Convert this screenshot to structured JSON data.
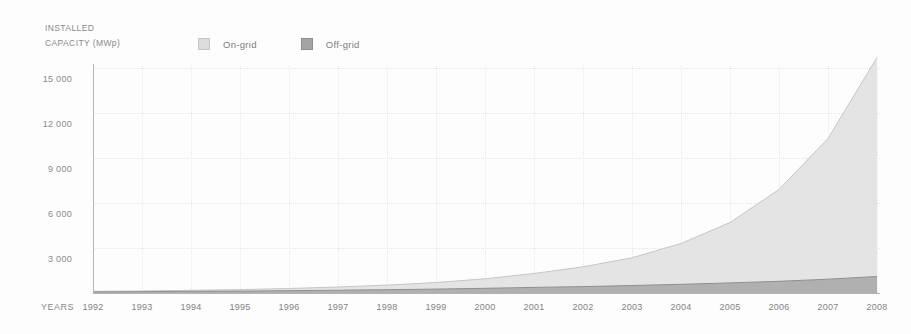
{
  "title": {
    "line1": "INSTALLED",
    "line2": "CAPACITY (MWp)"
  },
  "legend": [
    {
      "label": "On-grid",
      "color": "#dddddd",
      "border": "#c6c6c6"
    },
    {
      "label": "Off-grid",
      "color": "#a4a4a4",
      "border": "#8f8f8f"
    }
  ],
  "x_axis_title": "YEARS",
  "colors": {
    "background": "#fdfdfd",
    "text": "#8a8a8a",
    "axis": "#b3b3b3",
    "grid": "#e7e7e7",
    "on_grid_fill": "#e4e4e4",
    "on_grid_edge": "#c6c6c6",
    "off_grid_fill": "#b0b0b0",
    "off_grid_edge": "#8f8f8f"
  },
  "chart_data": {
    "type": "area",
    "stacked": true,
    "title": "INSTALLED CAPACITY (MWp)",
    "xlabel": "YEARS",
    "ylabel": "INSTALLED CAPACITY (MWp)",
    "x": [
      1992,
      1993,
      1994,
      1995,
      1996,
      1997,
      1998,
      1999,
      2000,
      2001,
      2002,
      2003,
      2004,
      2005,
      2006,
      2007,
      2008
    ],
    "series": [
      {
        "name": "Off-grid",
        "values": [
          75,
          90,
          110,
          130,
          155,
          185,
          220,
          260,
          310,
          370,
          430,
          500,
          580,
          670,
          780,
          920,
          1100
        ],
        "fill": "#b0b0b0",
        "edge": "#8f8f8f"
      },
      {
        "name": "On-grid",
        "values": [
          35,
          50,
          70,
          100,
          145,
          215,
          310,
          440,
          640,
          930,
          1320,
          1850,
          2720,
          4030,
          6120,
          9380,
          14600
        ],
        "fill": "#e4e4e4",
        "edge": "#c6c6c6"
      }
    ],
    "totals": [
      110,
      140,
      180,
      230,
      300,
      400,
      530,
      700,
      950,
      1300,
      1750,
      2350,
      3300,
      4700,
      6900,
      10300,
      15700
    ],
    "ylim": [
      0,
      16700
    ],
    "yticks": [
      3000,
      6000,
      9000,
      12000,
      15000
    ],
    "ytick_labels": [
      "3 000",
      "6 000",
      "9 000",
      "12 000",
      "15 000"
    ],
    "grid": true,
    "legend_position": "top"
  }
}
